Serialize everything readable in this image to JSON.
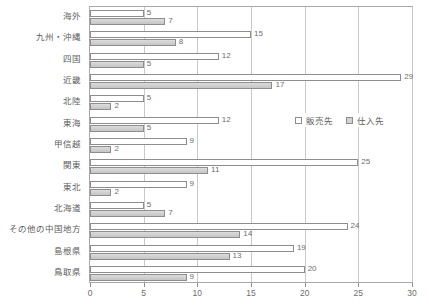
{
  "chart_data": {
    "type": "bar",
    "orientation": "horizontal",
    "title": "",
    "xlabel": "",
    "ylabel": "",
    "xlim": [
      0,
      30
    ],
    "xticks": [
      0,
      5,
      10,
      15,
      20,
      25,
      30
    ],
    "xtick_labels": [
      "0",
      "5",
      "10",
      "15",
      "20",
      "25",
      "30"
    ],
    "grid": true,
    "grid_axis": "x",
    "legend_position": "middle-right",
    "categories": [
      "海外",
      "九州・沖縄",
      "四国",
      "近畿",
      "北陸",
      "東海",
      "甲信越",
      "関東",
      "東北",
      "北海道",
      "その他の中国地方",
      "島根県",
      "鳥取県"
    ],
    "series": [
      {
        "name": "販売先",
        "color": "#ffffff",
        "border": "#8d8d8d",
        "values": [
          5,
          15,
          12,
          29,
          5,
          12,
          9,
          25,
          9,
          5,
          24,
          19,
          20
        ]
      },
      {
        "name": "仕入先",
        "color": "#d2d2d2",
        "border": "#8d8d8d",
        "values": [
          7,
          8,
          5,
          17,
          2,
          5,
          2,
          11,
          2,
          7,
          14,
          13,
          9
        ]
      }
    ]
  },
  "legend": {
    "items": [
      {
        "label": "販売先",
        "swatch": "sales"
      },
      {
        "label": "仕入先",
        "swatch": "purchase"
      }
    ]
  },
  "colors": {
    "sales_fill": "#ffffff",
    "purchase_fill": "#d2d2d2",
    "bar_border": "#8d8d8d",
    "gridline": "#c9c9c9",
    "frame": "#a8a8a8",
    "text": "#5d5d5d"
  }
}
